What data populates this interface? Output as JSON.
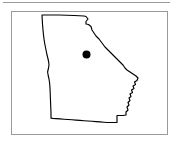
{
  "figure": {
    "type": "map",
    "title": "",
    "caption": "",
    "background_color": "#ffffff",
    "width_px": 174,
    "height_px": 146
  },
  "top_rule": {
    "name": "horizontal-rule",
    "color": "#9a9a9a",
    "thickness_px": 1
  },
  "panel": {
    "name": "map-panel",
    "border_color": "#9a9a9a",
    "border_width_px": 1,
    "fill_color": "#ffffff",
    "left_px": 11,
    "top_px": 11,
    "width_px": 157,
    "height_px": 124
  },
  "map": {
    "region_name": "Georgia",
    "outline_color": "#000000",
    "outline_width_px": 1.15,
    "fill_color": "#ffffff",
    "label": "",
    "outline_path": "M 30,3 L 47,3 L 62,3.5 L 72,4 L 74,4.5 L 76,7 L 74,9.5 L 74,12 L 76.5,12.5 L 79,14.5 L 80,18 L 82,21 L 84,24 L 87,27 L 90,31 L 93,35 L 96,38 L 99,41 L 102,44 L 105,47 L 108,50 L 111,53 L 113,56 L 115,58 L 118,60 L 121,62 L 124,64 L 126,66 L 125,68.5 L 122.5,70 L 123.5,72.5 L 121,74 L 122,76.5 L 119.5,78 L 120.5,80.5 L 118,82 L 119,84.5 L 117,86 L 118,88.5 L 116,90.5 L 117,93 L 115,95 L 116,98 L 114,100 L 114,103 L 111,103.5 L 108,103.5 L 105,103.5 L 105,107 L 105,110.5 L 101,110.5 L 98,110.5 L 95,110.5 L 92,110.2 L 88,109.9 L 84,109.6 L 80,109.3 L 76,109 L 72,108.7 L 68,108.4 L 64,108.1 L 60,107.8 L 56,107.5 L 52,107.2 L 48,106.9 L 44,106.6 L 41,106.4 L 39,106.2 L 39,101 L 38.8,96 L 38.6,91 L 38.4,86 L 38.2,81 L 38,76 L 37.6,71 L 37,67 L 36.2,63.5 L 35.6,60 L 36.4,56.5 L 37,53 L 36.6,49.5 L 35.8,46 L 34.8,42 L 33.8,37 L 32.8,32 L 32,27 L 31.4,22 L 30.9,17 L 30.5,12 L 30.2,7 Z",
    "marker": {
      "name": "location-marker",
      "shape": "filled-circle",
      "color": "#000000",
      "radius_px": 4,
      "center_x_px": 74.5,
      "center_y_px": 42.5,
      "label": ""
    }
  }
}
